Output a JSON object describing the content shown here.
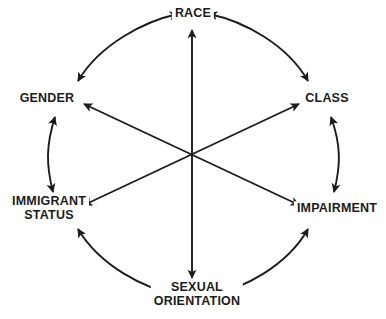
{
  "diagram": {
    "type": "cycle-wheel",
    "title": "",
    "background_color": "#ffffff",
    "line_color": "#1c1c1c",
    "text_color": "#1c1c1c",
    "center": {
      "x": 191,
      "y": 155
    },
    "nodes": [
      {
        "id": "race",
        "label": "RACE",
        "line1": "RACE",
        "line2": "",
        "position": "top",
        "x": 193,
        "y": 14,
        "angle_deg": 90
      },
      {
        "id": "class",
        "label": "CLASS",
        "line1": "CLASS",
        "line2": "",
        "position": "upper-right",
        "x": 327,
        "y": 99,
        "angle_deg": 30
      },
      {
        "id": "impairment",
        "label": "IMPAIRMENT",
        "line1": "IMPAIRMENT",
        "line2": "",
        "position": "lower-right",
        "x": 337,
        "y": 209,
        "angle_deg": -30
      },
      {
        "id": "sexual-orientation",
        "label": "SEXUAL ORIENTATION",
        "line1": "SEXUAL",
        "line2": "ORIENTATION",
        "position": "bottom",
        "x": 197,
        "y": 294,
        "angle_deg": -90
      },
      {
        "id": "immigrant-status",
        "label": "IMMIGRANT STATUS",
        "line1": "IMMIGRANT",
        "line2": "STATUS",
        "position": "lower-left",
        "x": 49,
        "y": 208,
        "angle_deg": 210
      },
      {
        "id": "gender",
        "label": "GENDER",
        "line1": "GENDER",
        "line2": "",
        "position": "upper-left",
        "x": 47,
        "y": 99,
        "angle_deg": 150
      }
    ],
    "arcs": [
      {
        "id": "arc-gender-race",
        "from": "gender",
        "to": "race",
        "double_headed": true
      },
      {
        "id": "arc-race-class",
        "from": "race",
        "to": "class",
        "double_headed": true
      },
      {
        "id": "arc-class-impairment",
        "from": "class",
        "to": "impairment",
        "double_headed": true
      },
      {
        "id": "arc-impairment-sexual-orientation",
        "from": "impairment",
        "to": "sexual-orientation",
        "double_headed": true
      },
      {
        "id": "arc-sexual-orientation-immigrant-status",
        "from": "sexual-orientation",
        "to": "immigrant-status",
        "double_headed": true
      },
      {
        "id": "arc-immigrant-status-gender",
        "from": "immigrant-status",
        "to": "gender",
        "double_headed": true
      }
    ],
    "diagonals": [
      {
        "id": "diagonal-race-sexual-orientation",
        "from": "race",
        "to": "sexual-orientation",
        "double_headed": true
      },
      {
        "id": "diagonal-gender-impairment",
        "from": "gender",
        "to": "impairment",
        "double_headed": true
      },
      {
        "id": "diagonal-immigrant-status-class",
        "from": "immigrant-status",
        "to": "class",
        "double_headed": true
      }
    ]
  }
}
